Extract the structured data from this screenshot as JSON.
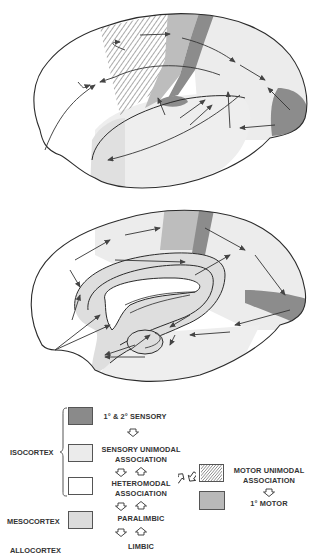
{
  "figure": {
    "type": "neuroanatomy diagram",
    "panels": [
      {
        "id": "lateral",
        "name": "lateral view of cerebral hemisphere"
      },
      {
        "id": "medial",
        "name": "medial view of cerebral hemisphere"
      }
    ]
  },
  "colors": {
    "primary_sensory": "#8a8a8a",
    "sensory_unimodal": "#ebebeb",
    "heteromodal": "#ffffff",
    "paralimbic": "#dcdcdc",
    "motor_unimodal_hatch": "#555555",
    "primary_motor": "#b9b9b9",
    "outline": "#2b2b2b"
  },
  "legend": {
    "groups": {
      "isocortex": "ISOCORTEX",
      "mesocortex": "MESOCORTEX",
      "allocortex": "ALLOCORTEX"
    },
    "items": {
      "primary_secondary_sensory": "1° & 2° SENSORY",
      "sensory_unimodal_line1": "SENSORY UNIMODAL",
      "sensory_unimodal_line2": "ASSOCIATION",
      "heteromodal_line1": "HETEROMODAL",
      "heteromodal_line2": "ASSOCIATION",
      "paralimbic": "PARALIMBIC",
      "limbic": "LIMBIC",
      "motor_unimodal_line1": "MOTOR UNIMODAL",
      "motor_unimodal_line2": "ASSOCIATION",
      "primary_motor": "1° MOTOR"
    }
  }
}
